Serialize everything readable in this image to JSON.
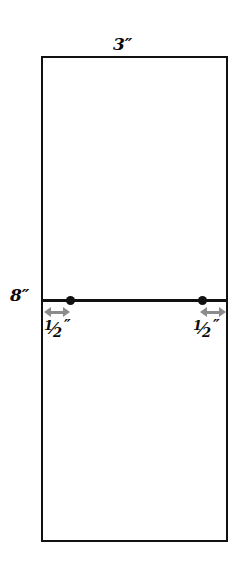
{
  "diagram": {
    "type": "technical-measurement-drawing",
    "background_color": "#ffffff",
    "line_color": "#111111",
    "arrow_color": "#8c8c8c",
    "shape": {
      "name": "rectangle",
      "width_label": "3″",
      "height_label": "8″",
      "width_value": 3,
      "height_value": 8,
      "units": "inches"
    },
    "labels": {
      "top_dimension": "3″",
      "left_dimension": "8″"
    },
    "offsets": [
      {
        "side": "left",
        "label_numerator": "1",
        "label_slash": "⁄",
        "label_denominator": "2",
        "label_prime": "″",
        "full_label": "1/2″",
        "value": 0.5,
        "units": "inches",
        "arrow": "double-headed"
      },
      {
        "side": "right",
        "label_numerator": "1",
        "label_slash": "⁄",
        "label_denominator": "2",
        "label_prime": "″",
        "full_label": "1/2″",
        "value": 0.5,
        "units": "inches",
        "arrow": "double-headed"
      }
    ],
    "points": [
      {
        "name": "left-point",
        "marker": "filled-dot"
      },
      {
        "name": "right-point",
        "marker": "filled-dot"
      }
    ],
    "divider": {
      "name": "horizontal-divider-line",
      "orientation": "horizontal"
    }
  }
}
